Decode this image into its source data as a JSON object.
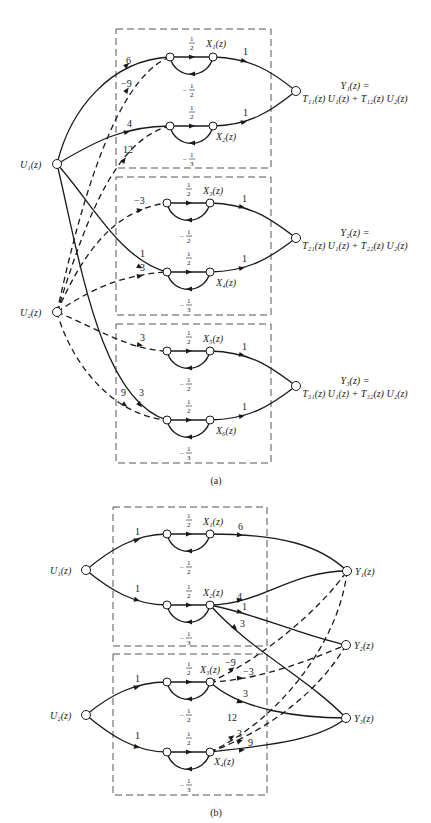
{
  "figure_a": {
    "caption": "(a)",
    "inputs": [
      {
        "id": "U1",
        "label": "U₁(z)"
      },
      {
        "id": "U2",
        "label": "U₂(z)"
      }
    ],
    "states": [
      {
        "id": "X1",
        "label": "X₁(z)",
        "forward_gain": "1/2",
        "feedback_gain": "−1/2"
      },
      {
        "id": "X2",
        "label": "X₂(z)",
        "forward_gain": "1/2",
        "feedback_gain": "−1/3"
      },
      {
        "id": "X3",
        "label": "X₃(z)",
        "forward_gain": "1/2",
        "feedback_gain": "−1/2"
      },
      {
        "id": "X4",
        "label": "X₄(z)",
        "forward_gain": "1/2",
        "feedback_gain": "−1/3"
      },
      {
        "id": "X5",
        "label": "X₅(z)",
        "forward_gain": "1/2",
        "feedback_gain": "−1/2"
      },
      {
        "id": "X6",
        "label": "X₆(z)",
        "forward_gain": "1/2",
        "feedback_gain": "−1/3"
      }
    ],
    "input_edges": [
      {
        "from": "U1",
        "to": "X1",
        "gain": "6",
        "style": "solid"
      },
      {
        "from": "U2",
        "to": "X1",
        "gain": "−9",
        "style": "dashed"
      },
      {
        "from": "U1",
        "to": "X2",
        "gain": "4",
        "style": "solid"
      },
      {
        "from": "U2",
        "to": "X2",
        "gain": "12",
        "style": "dashed"
      },
      {
        "from": "U2",
        "to": "X3",
        "gain": "−3",
        "style": "dashed"
      },
      {
        "from": "U1",
        "to": "X4",
        "gain": "1",
        "style": "solid"
      },
      {
        "from": "U2",
        "to": "X4",
        "gain": "3",
        "style": "dashed"
      },
      {
        "from": "U2",
        "to": "X5",
        "gain": "3",
        "style": "dashed"
      },
      {
        "from": "U2",
        "to": "X6",
        "gain": "9",
        "style": "dashed"
      },
      {
        "from": "U1",
        "to": "X6",
        "gain": "3",
        "style": "solid"
      }
    ],
    "output_edges": [
      {
        "from": "X1",
        "to": "Y1",
        "gain": "1"
      },
      {
        "from": "X2",
        "to": "Y1",
        "gain": "1"
      },
      {
        "from": "X3",
        "to": "Y2",
        "gain": "1"
      },
      {
        "from": "X4",
        "to": "Y2",
        "gain": "1"
      },
      {
        "from": "X5",
        "to": "Y3",
        "gain": "1"
      },
      {
        "from": "X6",
        "to": "Y3",
        "gain": "1"
      }
    ],
    "outputs": [
      {
        "id": "Y1",
        "line1": "Y₁(z) =",
        "line2": "T₁₁(z) U₁(z) + T₁₂(z) U₂(z)"
      },
      {
        "id": "Y2",
        "line1": "Y₂(z) =",
        "line2": "T₂₁(z) U₁(z) + T₂₂(z) U₂(z)"
      },
      {
        "id": "Y3",
        "line1": "Y₃(z) =",
        "line2": "T₃₁(z) U₁(z) + T₃₂(z) U₂(z)"
      }
    ]
  },
  "figure_b": {
    "caption": "(b)",
    "inputs": [
      {
        "id": "U1",
        "label": "U₁(z)"
      },
      {
        "id": "U2",
        "label": "U₂(z)"
      }
    ],
    "states": [
      {
        "id": "X1",
        "label": "X₁(z)",
        "forward_gain": "1/2",
        "feedback_gain": "−1/2"
      },
      {
        "id": "X2",
        "label": "X₂(z)",
        "forward_gain": "1/2",
        "feedback_gain": "−1/3"
      },
      {
        "id": "X3",
        "label": "X₃(z)",
        "forward_gain": "1/2",
        "feedback_gain": "−1/2"
      },
      {
        "id": "X4",
        "label": "X₄(z)",
        "forward_gain": "1/2",
        "feedback_gain": "−1/3"
      }
    ],
    "input_edges": [
      {
        "from": "U1",
        "to": "X1",
        "gain": "1"
      },
      {
        "from": "U1",
        "to": "X2",
        "gain": "1"
      },
      {
        "from": "U2",
        "to": "X3",
        "gain": "1"
      },
      {
        "from": "U2",
        "to": "X4",
        "gain": "1"
      }
    ],
    "output_edges": [
      {
        "from": "X1",
        "to": "Y1",
        "gain": "6",
        "style": "solid"
      },
      {
        "from": "X2",
        "to": "Y1",
        "gain": "4",
        "style": "solid"
      },
      {
        "from": "X2",
        "to": "Y2",
        "gain": "1",
        "style": "solid"
      },
      {
        "from": "X2",
        "to": "Y3",
        "gain": "3",
        "style": "solid"
      },
      {
        "from": "X3",
        "to": "Y1",
        "gain": "−9",
        "style": "dashed"
      },
      {
        "from": "X3",
        "to": "Y2",
        "gain": "−3",
        "style": "dashed"
      },
      {
        "from": "X3",
        "to": "Y3",
        "gain": "3",
        "style": "solid"
      },
      {
        "from": "X4",
        "to": "Y1",
        "gain": "12",
        "style": "dashed"
      },
      {
        "from": "X4",
        "to": "Y2",
        "gain": "3",
        "style": "dashed"
      },
      {
        "from": "X4",
        "to": "Y3",
        "gain": "9",
        "style": "solid"
      }
    ],
    "outputs": [
      {
        "id": "Y1",
        "label": "Y₁(z)"
      },
      {
        "id": "Y2",
        "label": "Y₂(z)"
      },
      {
        "id": "Y3",
        "label": "Y₃(z)"
      }
    ]
  },
  "fractions": {
    "half_num": "1",
    "half_den": "2",
    "third_den": "3",
    "minus": "−"
  }
}
